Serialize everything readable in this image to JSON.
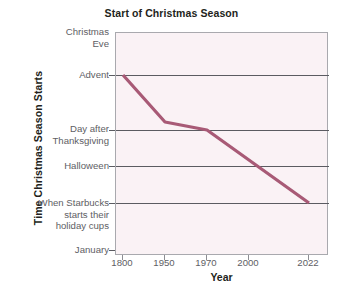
{
  "chart": {
    "title": "Start of Christmas Season",
    "xlabel": "Year",
    "ylabel": "Time Christmas Season Starts"
  },
  "chart_data": {
    "type": "line",
    "title": "Start of Christmas Season",
    "xlabel": "Year",
    "ylabel": "Time Christmas Season Starts",
    "grid": true,
    "legend": false,
    "x_axis_type": "categorical",
    "categories": [
      "1800",
      "1950",
      "1970",
      "2000",
      "2022"
    ],
    "y_categories": [
      "Christmas Eve",
      "Advent",
      "Day after Thanksgiving",
      "Halloween",
      "When Starbucks starts their holiday cups",
      "January"
    ],
    "y_order": "top-to-bottom (later in calendar at top, earlier at bottom)",
    "series": [
      {
        "name": "Start of Christmas Season",
        "color": "#a85a76",
        "points": [
          {
            "x": "1800",
            "y": "Advent"
          },
          {
            "x": "1950",
            "y": "just above Day after Thanksgiving"
          },
          {
            "x": "1970",
            "y": "Day after Thanksgiving"
          },
          {
            "x": "2022",
            "y": "When Starbucks starts their holiday cups"
          }
        ]
      }
    ],
    "annotations": []
  },
  "axes": {
    "y_ticks": [
      {
        "label_line1": "Christmas",
        "label_line2": "Eve",
        "has_gridline": false
      },
      {
        "label_line1": "Advent",
        "label_line2": "",
        "has_gridline": true
      },
      {
        "label_line1": "Day after",
        "label_line2": "Thanksgiving",
        "has_gridline": true
      },
      {
        "label_line1": "Halloween",
        "label_line2": "",
        "has_gridline": true
      },
      {
        "label_line1": "When Starbucks",
        "label_line2": "starts their",
        "label_line3": "holiday cups",
        "has_gridline": true
      },
      {
        "label_line1": "January",
        "label_line2": "",
        "has_gridline": false
      }
    ],
    "x_ticks": [
      "1800",
      "1950",
      "1970",
      "2000",
      "2022"
    ]
  },
  "colors": {
    "line": "#a85a76",
    "plot_background": "#faf2f5",
    "gridline": "#5b5b61",
    "plot_border": "#a9a9ae",
    "tick_label": "#5e5e64",
    "title": "#231f20"
  },
  "caption": {
    "clipped_text_left": "",
    "clipped_text_rest": ""
  }
}
